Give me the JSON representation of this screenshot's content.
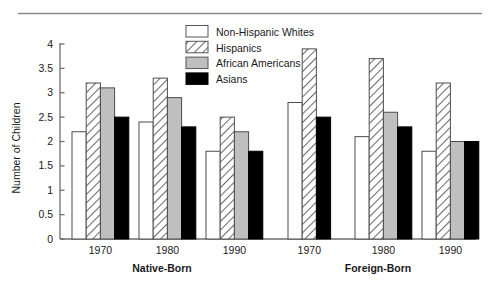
{
  "figure": {
    "top_rule": true,
    "background": "#ffffff",
    "axis_color": "#6e6e6e",
    "text_color": "#1a1a1a"
  },
  "legend": {
    "position": "top-center",
    "entries": [
      {
        "label": "Non-Hispanic Whites",
        "swatch": "white",
        "fill": "#ffffff"
      },
      {
        "label": "Hispanics",
        "swatch": "hatched",
        "fill": "#ffffff"
      },
      {
        "label": "African Americans",
        "swatch": "gray",
        "fill": "#bfbfbf"
      },
      {
        "label": "Asians",
        "swatch": "black",
        "fill": "#000000"
      }
    ]
  },
  "axes": {
    "ylabel": "Number of Children",
    "yticks": [
      "0",
      "0.5",
      "1",
      "1.5",
      "2",
      "2.5",
      "3",
      "3.5",
      "4"
    ],
    "ymin": 0,
    "ymax": 4,
    "xticklabels": [
      "1970",
      "1980",
      "1990",
      "1970",
      "1980",
      "1990"
    ],
    "group_labels": [
      "Native-Born",
      "Foreign-Born"
    ]
  },
  "chart_data": {
    "type": "bar",
    "title": "",
    "xlabel": "",
    "ylabel": "Number of Children",
    "ylim": [
      0,
      4
    ],
    "ytick_step": 0.5,
    "grid": false,
    "legend_position": "top-center",
    "groups": [
      "Native-Born",
      "Foreign-Born"
    ],
    "categories": [
      "1970",
      "1980",
      "1990",
      "1970",
      "1980",
      "1990"
    ],
    "category_groups": [
      "Native-Born",
      "Native-Born",
      "Native-Born",
      "Foreign-Born",
      "Foreign-Born",
      "Foreign-Born"
    ],
    "series": [
      {
        "name": "Non-Hispanic Whites",
        "fill": "#ffffff",
        "pattern": "solid-white",
        "values": [
          2.2,
          2.4,
          1.8,
          2.8,
          2.1,
          1.8
        ]
      },
      {
        "name": "Hispanics",
        "fill": "#ffffff",
        "pattern": "diagonal-hatch",
        "values": [
          3.2,
          3.3,
          2.5,
          3.9,
          3.7,
          3.2
        ]
      },
      {
        "name": "African Americans",
        "fill": "#bfbfbf",
        "pattern": "solid-gray",
        "values": [
          3.1,
          2.9,
          2.2,
          null,
          2.6,
          2.0
        ]
      },
      {
        "name": "Asians",
        "fill": "#000000",
        "pattern": "solid-black",
        "values": [
          2.5,
          2.3,
          1.8,
          2.5,
          2.3,
          2.0
        ]
      }
    ]
  }
}
